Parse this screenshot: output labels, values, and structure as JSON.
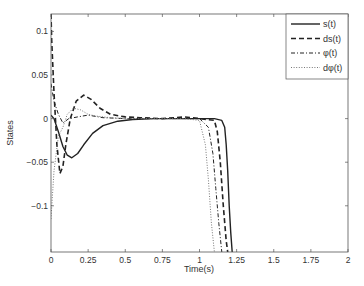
{
  "chart_data": {
    "type": "line",
    "title": "",
    "xlabel": "Time(s)",
    "ylabel": "States",
    "xlim": [
      0,
      2
    ],
    "ylim": [
      -0.153,
      0.12
    ],
    "grid": false,
    "legend_position": "upper right",
    "xticks": [
      0,
      0.25,
      0.5,
      0.75,
      1,
      1.25,
      1.5,
      1.75,
      2
    ],
    "xtick_labels": [
      "0",
      "0.25",
      "0.5",
      "0.75",
      "1",
      "1.25",
      "1.5",
      "1.75",
      "2"
    ],
    "yticks": [
      0.1,
      0.05,
      0,
      -0.05,
      -0.1
    ],
    "ytick_labels": [
      "0.1",
      "0.05",
      "0",
      "−0.05",
      "−0.1"
    ],
    "series": [
      {
        "name": "s(t)",
        "style": "solid",
        "width": 1.4,
        "x": [
          0,
          0.02,
          0.05,
          0.08,
          0.11,
          0.14,
          0.18,
          0.22,
          0.28,
          0.35,
          0.45,
          0.55,
          0.7,
          0.85,
          1.0,
          1.1,
          1.15,
          1.17,
          1.18,
          1.19,
          1.2,
          1.21,
          1.22
        ],
        "y": [
          0.004,
          0.0,
          -0.015,
          -0.032,
          -0.042,
          -0.045,
          -0.04,
          -0.03,
          -0.017,
          -0.008,
          -0.003,
          -0.001,
          0.0,
          0.0,
          0.0,
          0.0,
          -0.002,
          -0.01,
          -0.03,
          -0.06,
          -0.1,
          -0.13,
          -0.153
        ]
      },
      {
        "name": "ds(t)",
        "style": "dashed",
        "width": 1.6,
        "x": [
          0,
          0.005,
          0.02,
          0.04,
          0.06,
          0.08,
          0.1,
          0.13,
          0.17,
          0.22,
          0.27,
          0.33,
          0.4,
          0.5,
          0.6,
          0.75,
          0.9,
          1.0,
          1.1,
          1.12,
          1.14,
          1.16,
          1.18,
          1.19
        ],
        "y": [
          0.12,
          0.09,
          0.03,
          -0.03,
          -0.063,
          -0.055,
          -0.03,
          0.0,
          0.02,
          0.027,
          0.022,
          0.012,
          0.005,
          0.002,
          0.001,
          0.0,
          0.002,
          0.0,
          -0.002,
          -0.015,
          -0.05,
          -0.1,
          -0.14,
          -0.153
        ]
      },
      {
        "name": "φ(t)",
        "style": "dashdot",
        "width": 1.0,
        "x": [
          0,
          0.02,
          0.05,
          0.08,
          0.12,
          0.18,
          0.25,
          0.35,
          0.5,
          0.7,
          0.9,
          1.0,
          1.06,
          1.09,
          1.11,
          1.13,
          1.15
        ],
        "y": [
          0.04,
          0.02,
          0.005,
          -0.005,
          0.0,
          0.002,
          0.004,
          0.001,
          0.0,
          0.0,
          0.0,
          0.0,
          -0.01,
          -0.04,
          -0.08,
          -0.12,
          -0.153
        ]
      },
      {
        "name": "dφ(t)",
        "style": "dotted",
        "width": 1.0,
        "x": [
          0,
          0.02,
          0.05,
          0.08,
          0.11,
          0.15,
          0.2,
          0.25,
          0.3,
          0.4,
          0.5,
          0.7,
          0.9,
          1.0,
          1.04,
          1.06,
          1.08,
          1.1
        ],
        "y": [
          -0.115,
          -0.06,
          -0.02,
          -0.01,
          0.005,
          0.012,
          0.01,
          0.005,
          0.003,
          0.001,
          0.0,
          0.0,
          0.0,
          -0.002,
          -0.03,
          -0.07,
          -0.12,
          -0.153
        ]
      }
    ]
  }
}
